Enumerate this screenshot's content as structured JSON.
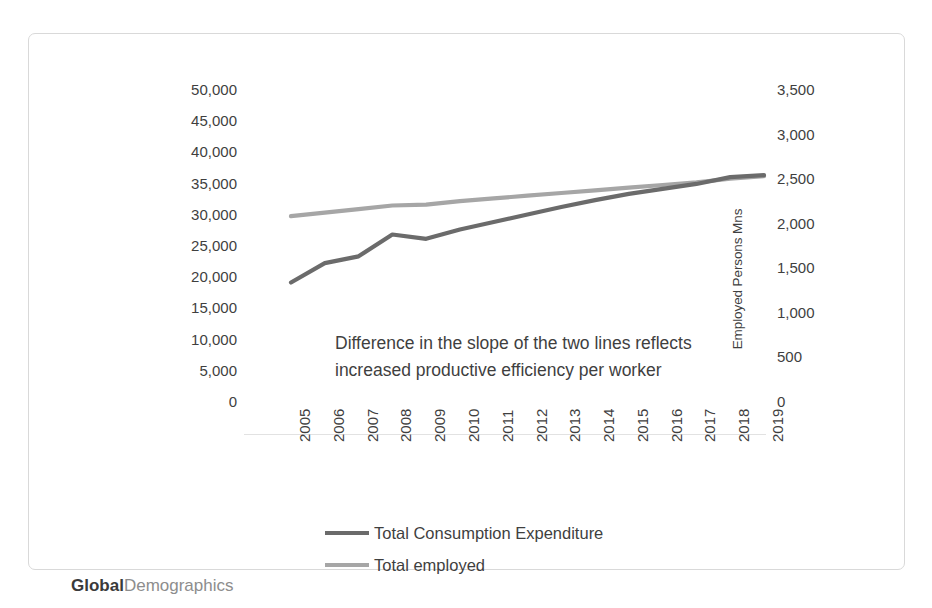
{
  "brand": {
    "strong": "Global",
    "light": "Demographics"
  },
  "annotation": {
    "text": "Difference in the slope of the two lines reflects increased productive efficiency per worker"
  },
  "colors": {
    "series_consumption": "#6b6b6b",
    "series_employed": "#a6a6a6",
    "axis_line": "#e2e2e2",
    "frame_border": "#d9d9d9",
    "text": "#3f3f3f"
  },
  "chart_data": {
    "type": "line",
    "title": "",
    "xlabel": "",
    "grid": false,
    "legend_position": "bottom",
    "categories": [
      "2005",
      "2006",
      "2007",
      "2008",
      "2009",
      "2010",
      "2011",
      "2012",
      "2013",
      "2014",
      "2015",
      "2016",
      "2017",
      "2018",
      "2019"
    ],
    "axes": {
      "left": {
        "label": "Global Consumption Expenditure US$ Bns\n2019 values",
        "ticks": [
          "50,000",
          "45,000",
          "40,000",
          "35,000",
          "30,000",
          "25,000",
          "20,000",
          "15,000",
          "10,000",
          "5,000",
          "0"
        ],
        "tick_values": [
          50000,
          45000,
          40000,
          35000,
          30000,
          25000,
          20000,
          15000,
          10000,
          5000,
          0
        ],
        "ylim": [
          0,
          50000
        ]
      },
      "right": {
        "label": "Employed Persons Mns",
        "ticks": [
          "3,500",
          "3,000",
          "2,500",
          "2,000",
          "1,500",
          "1,000",
          "500",
          "0"
        ],
        "tick_values": [
          3500,
          3000,
          2500,
          2000,
          1500,
          1000,
          500,
          0
        ],
        "ylim": [
          0,
          3500
        ]
      }
    },
    "series": [
      {
        "name": "Total Consumption Expenditure",
        "axis": "left",
        "color": "#6b6b6b",
        "values": [
          27800,
          30900,
          32000,
          35500,
          34800,
          36300,
          37500,
          38700,
          39900,
          41000,
          42000,
          42800,
          43600,
          44700,
          45000
        ]
      },
      {
        "name": "Total employed",
        "axis": "right",
        "color": "#a6a6a6",
        "values": [
          2690,
          2730,
          2770,
          2810,
          2820,
          2860,
          2890,
          2920,
          2950,
          2980,
          3010,
          3040,
          3070,
          3110,
          3140
        ]
      }
    ]
  }
}
